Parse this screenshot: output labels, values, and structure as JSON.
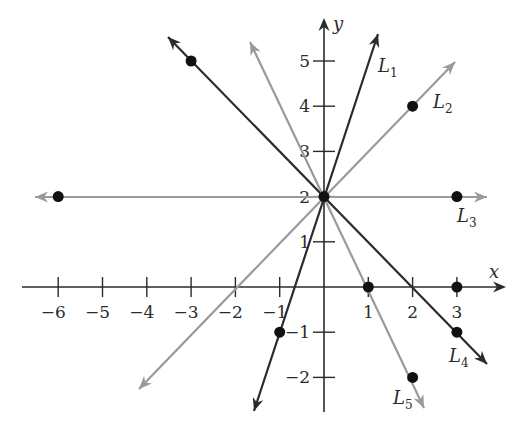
{
  "chart_data": {
    "type": "line",
    "title": "",
    "xlabel": "x",
    "ylabel": "y",
    "xlim": [
      -6.5,
      4.0
    ],
    "ylim": [
      -2.8,
      5.8
    ],
    "grid": false,
    "x_ticks": [
      -6,
      -5,
      -4,
      -3,
      -2,
      -1,
      1,
      2,
      3
    ],
    "y_ticks": [
      -2,
      -1,
      1,
      2,
      3,
      4,
      5
    ],
    "common_point": {
      "x": 0,
      "y": 2
    },
    "series": [
      {
        "name": "L1",
        "label": "L",
        "sub": "1",
        "color": "#2b2b2b",
        "slope": 3,
        "intercept": 2,
        "points": [
          {
            "x": -1,
            "y": -1
          },
          {
            "x": 0,
            "y": 2
          }
        ],
        "start": [
          254,
          411
        ],
        "end": [
          378,
          34
        ],
        "label_pos": [
          378,
          72
        ]
      },
      {
        "name": "L2",
        "label": "L",
        "sub": "2",
        "color": "#9a9a9a",
        "slope": 1,
        "intercept": 2,
        "points": [
          {
            "x": 0,
            "y": 2
          },
          {
            "x": 2,
            "y": 4
          }
        ],
        "start": [
          139,
          389
        ],
        "end": [
          455,
          62
        ],
        "label_pos": [
          433,
          108
        ]
      },
      {
        "name": "L3",
        "label": "L",
        "sub": "3",
        "color": "#9a9a9a",
        "slope": 0,
        "intercept": 2,
        "points": [
          {
            "x": -6,
            "y": 2
          },
          {
            "x": 0,
            "y": 2
          },
          {
            "x": 3,
            "y": 2
          }
        ],
        "start": [
          35,
          197
        ],
        "end": [
          487,
          197
        ],
        "label_pos": [
          457,
          222
        ]
      },
      {
        "name": "L4",
        "label": "L",
        "sub": "4",
        "color": "#2b2b2b",
        "slope": -1,
        "intercept": 2,
        "points": [
          {
            "x": -3,
            "y": 5
          },
          {
            "x": 0,
            "y": 2
          },
          {
            "x": 3,
            "y": -1
          }
        ],
        "start": [
          168,
          37
        ],
        "end": [
          487,
          364
        ],
        "label_pos": [
          449,
          362
        ]
      },
      {
        "name": "L5",
        "label": "L",
        "sub": "5",
        "color": "#9a9a9a",
        "slope": -2,
        "intercept": 2,
        "points": [
          {
            "x": 0,
            "y": 2
          },
          {
            "x": 1,
            "y": 0
          },
          {
            "x": 2,
            "y": -2
          }
        ],
        "start": [
          250,
          42
        ],
        "end": [
          424,
          408
        ],
        "label_pos": [
          393,
          404
        ]
      }
    ],
    "marked_points": [
      {
        "x": -3,
        "y": 5
      },
      {
        "x": 2,
        "y": 4
      },
      {
        "x": -6,
        "y": 2
      },
      {
        "x": 0,
        "y": 2
      },
      {
        "x": 3,
        "y": 2
      },
      {
        "x": 1,
        "y": 0
      },
      {
        "x": 3,
        "y": 0
      },
      {
        "x": -1,
        "y": -1
      },
      {
        "x": 3,
        "y": -1
      },
      {
        "x": 2,
        "y": -2
      }
    ]
  }
}
